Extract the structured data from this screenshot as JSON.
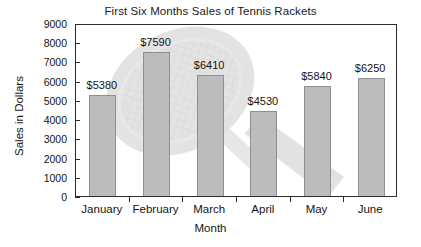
{
  "chart_data": {
    "type": "bar",
    "title": "First Six Months Sales of Tennis Rackets",
    "xlabel": "Month",
    "ylabel": "Sales in Dollars",
    "categories": [
      "January",
      "February",
      "March",
      "April",
      "May",
      "June"
    ],
    "values": [
      5380,
      7590,
      6410,
      4530,
      5840,
      6250
    ],
    "data_labels": [
      "$5380",
      "$7590",
      "$6410",
      "$4530",
      "$5840",
      "$6250"
    ],
    "ylim": [
      0,
      9000
    ],
    "ytick_values": [
      0,
      1000,
      2000,
      3000,
      4000,
      5000,
      6000,
      7000,
      8000,
      9000
    ],
    "ytick_labels": [
      "0",
      "1000",
      "2000",
      "3000",
      "4000",
      "5000",
      "6000",
      "7000",
      "8000",
      "9000"
    ],
    "grid": false,
    "legend": false,
    "bar_color": "#bcbcbc",
    "bar_border_color": "#8f8f8f",
    "axis_color": "#2b2b2b",
    "background_color": "#ffffff",
    "watermark": "tennis-racket"
  }
}
